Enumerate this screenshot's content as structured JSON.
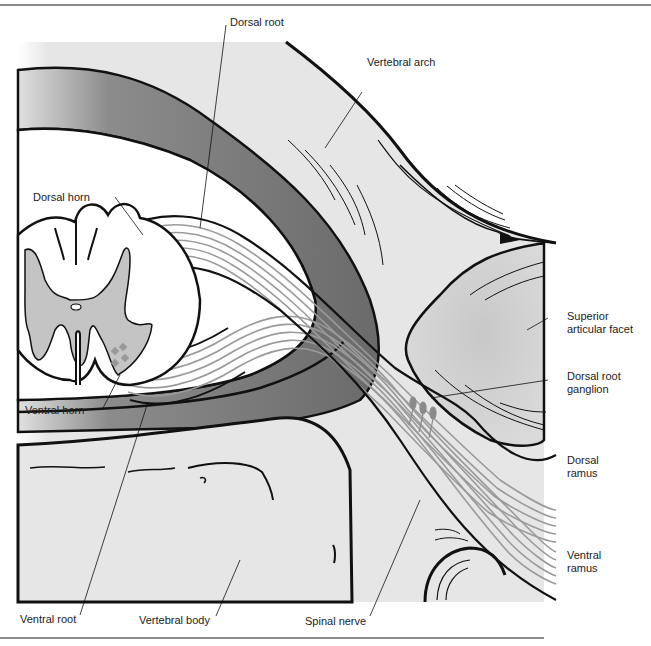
{
  "figure": {
    "type": "anatomical-diagram",
    "colors": {
      "background": "#e6e6e6",
      "dura_dark": "#6e6e6e",
      "gray_matter": "#c4c4c4",
      "white_matter": "#ffffff",
      "outline": "#111111",
      "nerve_fiber": "#9a9a9a",
      "facet": "#cfcfcf"
    }
  },
  "labels": {
    "dorsal_root": "Dorsal root",
    "vertebral_arch": "Vertebral arch",
    "dorsal_horn": "Dorsal horn",
    "superior_articular_facet_line1": "Superior",
    "superior_articular_facet_line2": "articular facet",
    "dorsal_root_ganglion_line1": "Dorsal root",
    "dorsal_root_ganglion_line2": "ganglion",
    "ventral_horn": "Ventral horn",
    "dorsal_ramus_line1": "Dorsal",
    "dorsal_ramus_line2": "ramus",
    "ventral_ramus_line1": "Ventral",
    "ventral_ramus_line2": "ramus",
    "ventral_root": "Ventral root",
    "vertebral_body": "Vertebral body",
    "spinal_nerve": "Spinal nerve"
  }
}
